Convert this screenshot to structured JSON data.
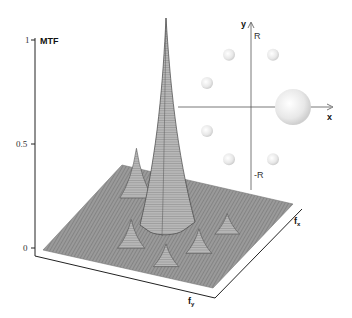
{
  "chart_data": {
    "type": "surface3d",
    "title": "",
    "zlabel": "MTF",
    "xlabel": "f_x",
    "ylabel": "f_y",
    "z_ticks": [
      "0",
      "0.5",
      "1"
    ],
    "zlim": [
      0,
      1
    ],
    "peak": {
      "fx": 0,
      "fy": 0,
      "mtf": 1.0
    },
    "side_lobes": [
      {
        "fx": -0.6,
        "fy": -0.5,
        "mtf": 0.22
      },
      {
        "fx": -0.3,
        "fy": -0.7,
        "mtf": 0.16
      },
      {
        "fx": 0.5,
        "fy": 0.3,
        "mtf": 0.1
      },
      {
        "fx": 0.6,
        "fy": -0.2,
        "mtf": 0.08
      },
      {
        "fx": -0.2,
        "fy": 0.5,
        "mtf": 0.12
      },
      {
        "fx": 0.3,
        "fy": 0.7,
        "mtf": 0.09
      }
    ],
    "inset": {
      "description": "Aperture arrangement: one large circle on +x axis and six small circles on a ring of radius R",
      "x_axis_label": "x",
      "y_axis_label": "y",
      "r_label_top": "R",
      "r_label_bottom": "-R",
      "large_circle": {
        "x": 1.0,
        "y": 0.0
      },
      "small_circles": [
        {
          "x": -0.5,
          "y": 0.87
        },
        {
          "x": 0.5,
          "y": 0.87
        },
        {
          "x": -1.0,
          "y": 0.4
        },
        {
          "x": -1.0,
          "y": -0.4
        },
        {
          "x": -0.5,
          "y": -0.87
        },
        {
          "x": 0.5,
          "y": -0.87
        }
      ]
    }
  }
}
